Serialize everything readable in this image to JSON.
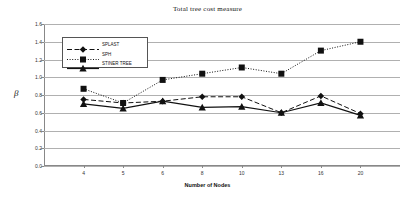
{
  "chart_data": {
    "type": "line",
    "title": "Total tree cost measure",
    "xlabel": "Number of Nodes",
    "ylabel": "β",
    "categories": [
      "4",
      "5",
      "6",
      "8",
      "10",
      "13",
      "16",
      "20"
    ],
    "ytick_labels": [
      "0.0",
      "0.2",
      "0.4",
      "0.6",
      "0.8",
      "1.0",
      "1.2",
      "1.4",
      "1.6"
    ],
    "yticks": [
      0.0,
      0.2,
      0.4,
      0.6,
      0.8,
      1.0,
      1.2,
      1.4,
      1.6
    ],
    "ylim": [
      0.0,
      1.6
    ],
    "grid": true,
    "legend_position": "upper-left-inside",
    "series": [
      {
        "name": "SPLAST",
        "values": [
          0.75,
          0.71,
          0.73,
          0.78,
          0.78,
          0.6,
          0.79,
          0.59
        ],
        "marker": "diamond",
        "line_style": "dashed",
        "color": "#111111"
      },
      {
        "name": "SPH",
        "values": [
          0.87,
          0.71,
          0.97,
          1.04,
          1.11,
          1.04,
          1.3,
          1.4
        ],
        "marker": "square",
        "line_style": "dotted",
        "color": "#111111"
      },
      {
        "name": "STINER TREE",
        "values": [
          0.7,
          0.65,
          0.73,
          0.66,
          0.67,
          0.6,
          0.71,
          0.57
        ],
        "marker": "triangle",
        "line_style": "solid",
        "color": "#111111"
      }
    ]
  }
}
